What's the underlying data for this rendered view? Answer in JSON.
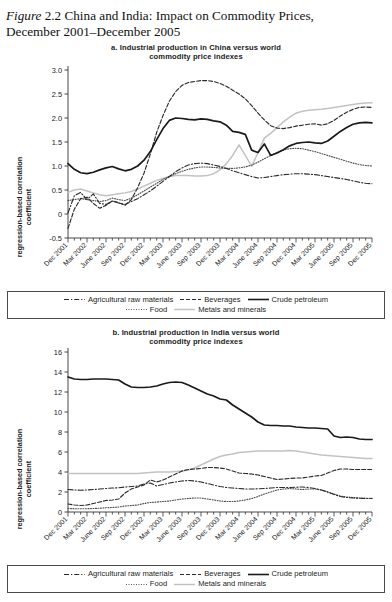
{
  "figure": {
    "label": "Figure",
    "number": "2.2",
    "caption_line1": "China and India: Impact on Commodity Prices,",
    "caption_line2": "December 2001–December 2005"
  },
  "legend": {
    "rows": [
      [
        {
          "name": "Agricultural raw materials",
          "style": "dashdot",
          "color": "#2b2b2b"
        },
        {
          "name": "Beverages",
          "style": "dashed",
          "color": "#2b2b2b"
        },
        {
          "name": "Crude petroleum",
          "style": "solid",
          "color": "#1a1a1a"
        }
      ],
      [
        {
          "name": "Food",
          "style": "dotted",
          "color": "#4d4d4d"
        },
        {
          "name": "Metals and minerals",
          "style": "solid-light",
          "color": "#c2c2c2"
        }
      ]
    ]
  },
  "chart_data": [
    {
      "id": "panel-a",
      "type": "line",
      "title": "a. Industrial production in China versus world commodity price indexes",
      "title_line1": "a. Industrial production in China versus world",
      "title_line2": "commodity price indexes",
      "ylabel": "regression-based correlation coefficient",
      "ylabel_line1": "regression-based correlation",
      "ylabel_line2": "coefficient",
      "xlabel": "",
      "ylim": [
        -0.5,
        3.0
      ],
      "yticks": [
        "-0.5",
        "0",
        "0.5",
        "1.0",
        "1.5",
        "2.0",
        "2.5",
        "3.0"
      ],
      "ytick_values": [
        -0.5,
        0,
        0.5,
        1.0,
        1.5,
        2.0,
        2.5,
        3.0
      ],
      "grid": false,
      "legend_position": "below",
      "categories": [
        "Dec 2001",
        "Mar 2002",
        "June 2002",
        "Sep 2002",
        "Dec 2002",
        "Mar 2003",
        "June 2003",
        "Sep 2003",
        "Dec 2003",
        "Mar 2004",
        "June 2004",
        "Sep 2004",
        "Dec 2004",
        "Mar 2005",
        "June 2005",
        "Sep 2005",
        "Dec 2005"
      ],
      "x_months": 49,
      "series": [
        {
          "name": "Crude petroleum",
          "style": "solid",
          "color": "#1a1a1a",
          "values": [
            1.05,
            0.93,
            0.86,
            0.84,
            0.87,
            0.92,
            0.96,
            0.99,
            0.94,
            0.9,
            0.93,
            1.0,
            1.12,
            1.3,
            1.55,
            1.78,
            1.95,
            2.0,
            1.99,
            1.97,
            1.96,
            1.98,
            1.97,
            1.94,
            1.92,
            1.85,
            1.72,
            1.7,
            1.66,
            1.33,
            1.28,
            1.46,
            1.22,
            1.27,
            1.34,
            1.42,
            1.47,
            1.49,
            1.5,
            1.48,
            1.47,
            1.52,
            1.62,
            1.72,
            1.8,
            1.87,
            1.9,
            1.91,
            1.9
          ]
        },
        {
          "name": "Beverages",
          "style": "dashed",
          "color": "#2b2b2b",
          "values": [
            -0.3,
            0.1,
            0.32,
            0.35,
            0.22,
            0.12,
            0.18,
            0.27,
            0.24,
            0.18,
            0.3,
            0.55,
            0.85,
            1.25,
            1.7,
            2.05,
            2.35,
            2.55,
            2.68,
            2.74,
            2.76,
            2.78,
            2.78,
            2.76,
            2.72,
            2.66,
            2.58,
            2.5,
            2.4,
            2.26,
            2.1,
            1.96,
            1.84,
            1.79,
            1.78,
            1.8,
            1.83,
            1.85,
            1.87,
            1.88,
            1.85,
            1.88,
            1.95,
            2.04,
            2.12,
            2.18,
            2.22,
            2.23,
            2.22
          ]
        },
        {
          "name": "Agricultural raw materials",
          "style": "dashdot",
          "color": "#2b2b2b",
          "values": [
            0.02,
            0.38,
            0.45,
            0.3,
            0.42,
            0.22,
            0.2,
            0.27,
            0.23,
            0.2,
            0.26,
            0.32,
            0.4,
            0.48,
            0.58,
            0.68,
            0.78,
            0.88,
            0.96,
            1.02,
            1.05,
            1.06,
            1.05,
            1.02,
            0.99,
            0.95,
            0.9,
            0.86,
            0.82,
            0.78,
            0.75,
            0.76,
            0.78,
            0.8,
            0.82,
            0.83,
            0.84,
            0.84,
            0.83,
            0.82,
            0.8,
            0.78,
            0.76,
            0.74,
            0.72,
            0.69,
            0.66,
            0.64,
            0.63
          ]
        },
        {
          "name": "Food",
          "style": "dotted",
          "color": "#4d4d4d",
          "values": [
            0.28,
            0.3,
            0.32,
            0.3,
            0.28,
            0.26,
            0.28,
            0.33,
            0.3,
            0.28,
            0.33,
            0.4,
            0.48,
            0.56,
            0.64,
            0.72,
            0.78,
            0.84,
            0.89,
            0.93,
            0.96,
            0.98,
            0.98,
            0.97,
            0.96,
            0.95,
            0.95,
            0.96,
            0.98,
            1.02,
            1.08,
            1.15,
            1.22,
            1.28,
            1.33,
            1.36,
            1.37,
            1.36,
            1.33,
            1.3,
            1.26,
            1.22,
            1.18,
            1.14,
            1.1,
            1.06,
            1.03,
            1.01,
            1.0
          ]
        },
        {
          "name": "Metals and minerals",
          "style": "solid-light",
          "color": "#c2c2c2",
          "values": [
            0.45,
            0.5,
            0.52,
            0.48,
            0.44,
            0.4,
            0.38,
            0.4,
            0.42,
            0.44,
            0.47,
            0.52,
            0.58,
            0.64,
            0.7,
            0.74,
            0.78,
            0.8,
            0.8,
            0.8,
            0.79,
            0.79,
            0.8,
            0.84,
            0.92,
            1.05,
            1.22,
            1.44,
            1.22,
            0.99,
            1.28,
            1.58,
            1.68,
            1.8,
            1.92,
            2.02,
            2.1,
            2.14,
            2.16,
            2.17,
            2.18,
            2.2,
            2.22,
            2.24,
            2.26,
            2.28,
            2.3,
            2.31,
            2.32
          ]
        }
      ]
    },
    {
      "id": "panel-b",
      "type": "line",
      "title": "b. Industrial production in India versus world commodity price indexes",
      "title_line1": "b. Industrial production in India versus world",
      "title_line2": "commodity price indexes",
      "ylabel": "regression-based correlation coefficient",
      "ylabel_line1": "regression-based correlation",
      "ylabel_line2": "coefficient",
      "xlabel": "",
      "ylim": [
        0,
        16
      ],
      "yticks": [
        "0",
        "2",
        "4",
        "6",
        "8",
        "10",
        "12",
        "14",
        "16"
      ],
      "ytick_values": [
        0,
        2,
        4,
        6,
        8,
        10,
        12,
        14,
        16
      ],
      "grid": false,
      "legend_position": "below",
      "categories": [
        "Dec 2001",
        "Mar 2002",
        "June 2002",
        "Sep 2002",
        "Dec 2002",
        "Mar 2003",
        "June 2003",
        "Sep 2003",
        "Dec 2003",
        "Mar 2004",
        "June 2004",
        "Sep 2004",
        "Dec 2004",
        "Mar 2005",
        "June 2005",
        "Sep 2005",
        "Dec 2005"
      ],
      "x_months": 49,
      "series": [
        {
          "name": "Crude petroleum",
          "style": "solid",
          "color": "#1a1a1a",
          "values": [
            13.5,
            13.3,
            13.25,
            13.25,
            13.3,
            13.3,
            13.3,
            13.25,
            13.2,
            12.8,
            12.5,
            12.45,
            12.45,
            12.5,
            12.6,
            12.8,
            12.95,
            13.0,
            12.95,
            12.7,
            12.4,
            12.1,
            11.8,
            11.6,
            11.3,
            11.2,
            10.7,
            10.3,
            9.9,
            9.5,
            9.0,
            8.7,
            8.65,
            8.65,
            8.6,
            8.6,
            8.5,
            8.45,
            8.4,
            8.4,
            8.35,
            8.3,
            7.6,
            7.45,
            7.5,
            7.45,
            7.3,
            7.25,
            7.25
          ]
        },
        {
          "name": "Metals and minerals",
          "style": "solid-light",
          "color": "#c2c2c2",
          "values": [
            3.85,
            3.85,
            3.85,
            3.85,
            3.85,
            3.85,
            3.85,
            3.85,
            3.85,
            3.85,
            3.85,
            3.85,
            3.9,
            3.95,
            4.0,
            4.0,
            4.0,
            4.05,
            4.1,
            4.2,
            4.4,
            4.7,
            5.0,
            5.3,
            5.55,
            5.7,
            5.8,
            5.95,
            6.0,
            6.05,
            6.1,
            6.1,
            6.1,
            6.1,
            6.1,
            6.15,
            6.1,
            6.0,
            5.9,
            5.8,
            5.7,
            5.65,
            5.6,
            5.55,
            5.5,
            5.45,
            5.4,
            5.35,
            5.35
          ]
        },
        {
          "name": "Beverages",
          "style": "dashed",
          "color": "#2b2b2b",
          "values": [
            0.8,
            0.7,
            0.65,
            0.7,
            0.85,
            1.0,
            1.15,
            1.2,
            1.3,
            1.9,
            2.3,
            2.5,
            2.7,
            3.2,
            3.0,
            3.2,
            3.5,
            3.8,
            4.1,
            4.25,
            4.3,
            4.35,
            4.45,
            4.45,
            4.4,
            4.3,
            4.1,
            3.9,
            3.85,
            3.8,
            3.7,
            3.55,
            3.4,
            3.25,
            3.3,
            3.35,
            3.4,
            3.4,
            3.5,
            3.6,
            3.65,
            3.9,
            4.15,
            4.3,
            4.3,
            4.25,
            4.25,
            4.25,
            4.25
          ]
        },
        {
          "name": "Agricultural raw materials",
          "style": "dashdot",
          "color": "#2b2b2b",
          "values": [
            2.25,
            2.2,
            2.18,
            2.2,
            2.25,
            2.3,
            2.35,
            2.4,
            2.42,
            2.5,
            2.55,
            2.6,
            2.8,
            2.9,
            2.6,
            2.75,
            2.9,
            3.0,
            3.1,
            3.15,
            3.1,
            3.0,
            2.85,
            2.7,
            2.55,
            2.45,
            2.4,
            2.35,
            2.3,
            2.3,
            2.32,
            2.35,
            2.4,
            2.45,
            2.45,
            2.45,
            2.48,
            2.5,
            2.45,
            2.35,
            2.2,
            2.0,
            1.75,
            1.55,
            1.45,
            1.4,
            1.38,
            1.35,
            1.35
          ]
        },
        {
          "name": "Food",
          "style": "dotted",
          "color": "#4d4d4d",
          "values": [
            0.35,
            0.33,
            0.32,
            0.33,
            0.35,
            0.38,
            0.42,
            0.45,
            0.5,
            0.6,
            0.65,
            0.7,
            0.85,
            0.95,
            1.0,
            1.05,
            1.1,
            1.2,
            1.3,
            1.35,
            1.4,
            1.4,
            1.3,
            1.2,
            1.1,
            1.05,
            1.05,
            1.1,
            1.2,
            1.35,
            1.55,
            1.8,
            2.0,
            2.2,
            2.3,
            2.35,
            2.3,
            2.25,
            2.3,
            2.3,
            2.2,
            2.0,
            1.8,
            1.6,
            1.5,
            1.45,
            1.4,
            1.38,
            1.38
          ]
        }
      ]
    }
  ]
}
